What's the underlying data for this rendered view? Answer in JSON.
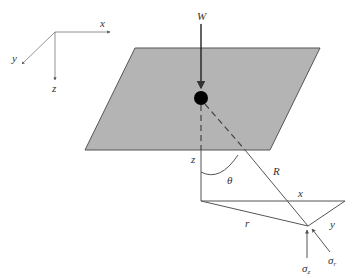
{
  "axes": {
    "x": "x",
    "y": "y",
    "z": "z"
  },
  "load": {
    "label": "W"
  },
  "geometry": {
    "depth": "z",
    "angle": "θ",
    "radial_distance": "R",
    "horizontal_distance": "r",
    "x_offset": "x",
    "y_offset": "y"
  },
  "stresses": {
    "vertical": {
      "symbol": "σ",
      "sub": "z"
    },
    "radial": {
      "symbol": "σ",
      "sub": "r"
    }
  },
  "colors": {
    "plane_fill": "#b4b4b4",
    "line": "#444444",
    "point": "#000000"
  }
}
